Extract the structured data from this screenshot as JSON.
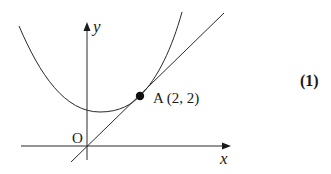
{
  "figure": {
    "type": "diagram",
    "axes": {
      "x_label": "x",
      "y_label": "y",
      "origin_label": "O"
    },
    "point": {
      "name": "A",
      "coords_text": "A (2, 2)"
    },
    "equation_number": "(1)",
    "colors": {
      "stroke": "#2a2a2a",
      "background": "#ffffff"
    }
  }
}
